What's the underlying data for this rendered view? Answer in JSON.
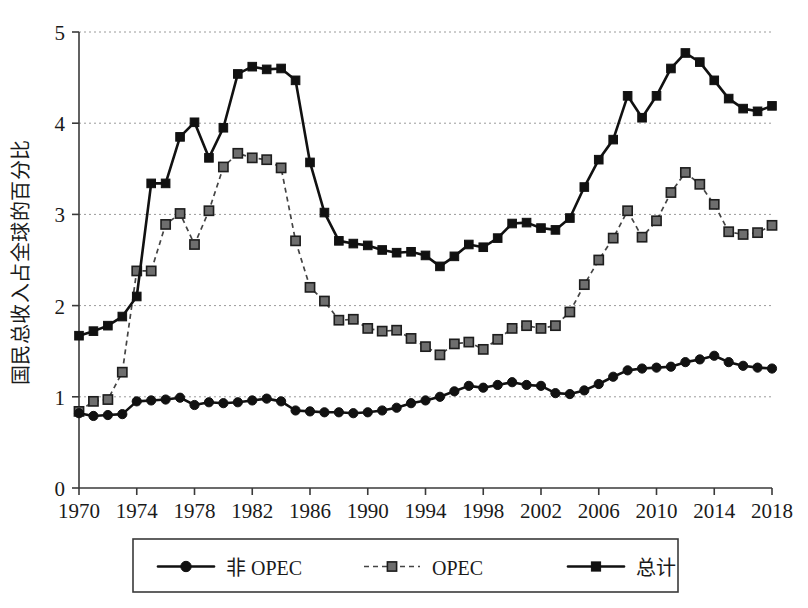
{
  "chart_data": {
    "type": "line",
    "title": "",
    "xlabel": "",
    "ylabel": "国民总收入占全球的百分比",
    "xlim": [
      1970,
      2018
    ],
    "ylim": [
      0,
      5
    ],
    "ytick_labels": [
      "0",
      "1",
      "2",
      "3",
      "4",
      "5"
    ],
    "yticks": [
      0,
      1,
      2,
      3,
      4,
      5
    ],
    "xtick_labels": [
      "1970",
      "1974",
      "1978",
      "1982",
      "1986",
      "1990",
      "1994",
      "1998",
      "2002",
      "2006",
      "2010",
      "2014",
      "2018"
    ],
    "xticks": [
      1970,
      1974,
      1978,
      1982,
      1986,
      1990,
      1994,
      1998,
      2002,
      2006,
      2010,
      2014,
      2018
    ],
    "grid": "horizontal-dotted",
    "legend_position": "bottom-outside",
    "x": [
      1970,
      1971,
      1972,
      1973,
      1974,
      1975,
      1976,
      1977,
      1978,
      1979,
      1980,
      1981,
      1982,
      1983,
      1984,
      1985,
      1986,
      1987,
      1988,
      1989,
      1990,
      1991,
      1992,
      1993,
      1994,
      1995,
      1996,
      1997,
      1998,
      1999,
      2000,
      2001,
      2002,
      2003,
      2004,
      2005,
      2006,
      2007,
      2008,
      2009,
      2010,
      2011,
      2012,
      2013,
      2014,
      2015,
      2016,
      2017,
      2018
    ],
    "series": [
      {
        "name": "非 OPEC",
        "marker": "circle",
        "line_style": "solid",
        "color": "#111111",
        "values": [
          0.82,
          0.79,
          0.8,
          0.81,
          0.95,
          0.96,
          0.97,
          0.99,
          0.91,
          0.94,
          0.93,
          0.94,
          0.96,
          0.98,
          0.95,
          0.85,
          0.84,
          0.83,
          0.83,
          0.82,
          0.83,
          0.85,
          0.88,
          0.93,
          0.96,
          1.0,
          1.06,
          1.12,
          1.1,
          1.13,
          1.16,
          1.13,
          1.12,
          1.04,
          1.03,
          1.07,
          1.14,
          1.22,
          1.29,
          1.31,
          1.32,
          1.33,
          1.38,
          1.41,
          1.45,
          1.38,
          1.34,
          1.32,
          1.31
        ]
      },
      {
        "name": "OPEC",
        "marker": "square",
        "line_style": "dashed",
        "color": "#6e6e6e",
        "values": [
          0.84,
          0.95,
          0.97,
          1.27,
          2.38,
          2.38,
          2.89,
          3.01,
          2.67,
          3.04,
          3.52,
          3.67,
          3.62,
          3.6,
          3.51,
          2.71,
          2.2,
          2.05,
          1.84,
          1.85,
          1.75,
          1.72,
          1.73,
          1.64,
          1.55,
          1.46,
          1.58,
          1.6,
          1.52,
          1.63,
          1.75,
          1.78,
          1.75,
          1.78,
          1.93,
          2.23,
          2.5,
          2.74,
          3.04,
          2.75,
          2.93,
          3.24,
          3.46,
          3.33,
          3.11,
          2.81,
          2.78,
          2.8,
          2.88
        ]
      },
      {
        "name": "总计",
        "marker": "square",
        "line_style": "solid",
        "color": "#111111",
        "values": [
          1.67,
          1.72,
          1.78,
          1.88,
          2.1,
          3.34,
          3.34,
          3.85,
          4.01,
          3.62,
          3.95,
          4.54,
          4.62,
          4.59,
          4.6,
          4.47,
          3.57,
          3.02,
          2.71,
          2.68,
          2.66,
          2.61,
          2.58,
          2.59,
          2.55,
          2.43,
          2.54,
          2.67,
          2.64,
          2.74,
          2.9,
          2.91,
          2.85,
          2.83,
          2.96,
          3.3,
          3.6,
          3.82,
          4.3,
          4.06,
          4.3,
          4.6,
          4.77,
          4.67,
          4.47,
          4.27,
          4.16,
          4.13,
          4.19
        ]
      }
    ]
  },
  "legend": {
    "items": [
      {
        "label": "非 OPEC",
        "marker": "circle",
        "style": "solid"
      },
      {
        "label": "OPEC",
        "marker": "square-gray",
        "style": "dashed"
      },
      {
        "label": "总计",
        "marker": "square-dark",
        "style": "solid"
      }
    ]
  }
}
